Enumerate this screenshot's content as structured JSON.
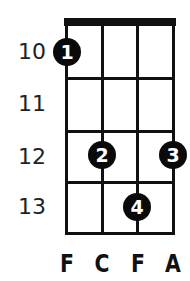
{
  "diagram": {
    "type": "chord-diagram",
    "instrument_strings": [
      "F",
      "C",
      "F",
      "A"
    ],
    "fret_numbers": [
      "10",
      "11",
      "12",
      "13"
    ],
    "fingers": [
      {
        "finger": "1",
        "string_index": 0,
        "fret": "10"
      },
      {
        "finger": "2",
        "string_index": 1,
        "fret": "12"
      },
      {
        "finger": "3",
        "string_index": 3,
        "fret": "12"
      },
      {
        "finger": "4",
        "string_index": 2,
        "fret": "13"
      }
    ],
    "colors": {
      "line": "#111111",
      "dot": "#0a0a0a",
      "dot_text": "#ffffff",
      "background": "#ffffff"
    }
  }
}
